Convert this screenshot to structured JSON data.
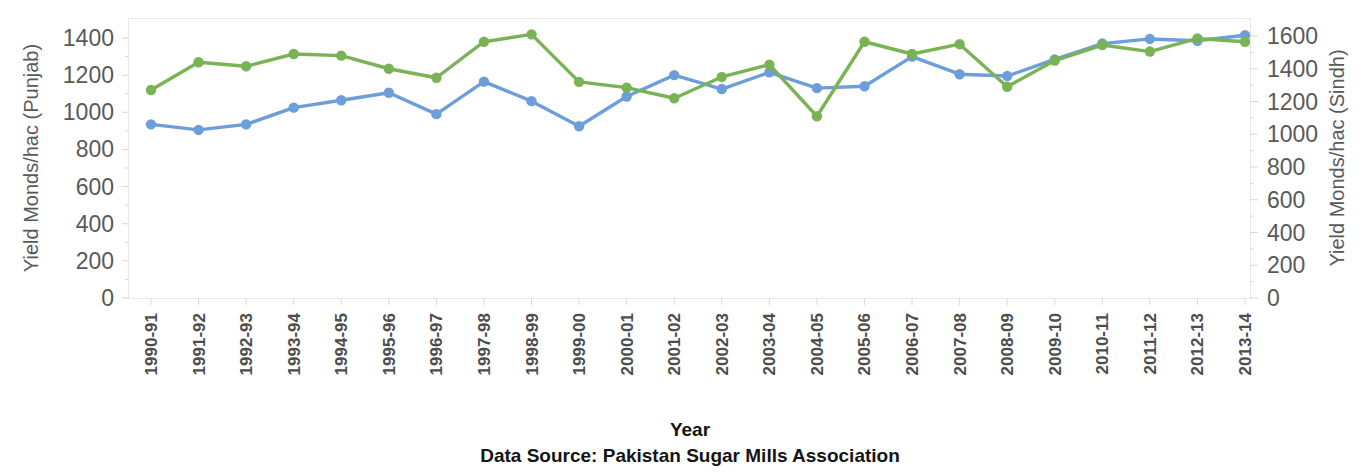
{
  "chart_data": {
    "type": "line",
    "title": "",
    "xlabel": "Year",
    "source_note": "Data Source: Pakistan Sugar Mills Association",
    "grid": false,
    "legend": "none",
    "categories": [
      "1990-91",
      "1991-92",
      "1992-93",
      "1993-94",
      "1994-95",
      "1995-96",
      "1996-97",
      "1997-98",
      "1998-99",
      "1999-00",
      "2000-01",
      "2001-02",
      "2002-03",
      "2003-04",
      "2004-05",
      "2005-06",
      "2006-07",
      "2007-08",
      "2008-09",
      "2009-10",
      "2010-11",
      "2011-12",
      "2012-13",
      "2013-14"
    ],
    "axes": {
      "left": {
        "label": "Yield Monds/hac (Punjab)",
        "ticks": [
          0,
          200,
          400,
          600,
          800,
          1000,
          1200,
          1400
        ],
        "tick_labels": [
          "0",
          "200",
          "400",
          "600",
          "800",
          "1000",
          "1200",
          "1400"
        ],
        "min": 0,
        "max": 1400
      },
      "right": {
        "label": "Yield Monds/hac (Sindh)",
        "ticks": [
          0,
          200,
          400,
          600,
          800,
          1000,
          1200,
          1400,
          1600
        ],
        "tick_labels": [
          "0",
          "200",
          "400",
          "600",
          "800",
          "1000",
          "1200",
          "1400",
          "1600"
        ],
        "min": 0,
        "max": 1600
      }
    },
    "series": [
      {
        "name": "Punjab",
        "axis": "left",
        "color": "#6d9eda",
        "values": [
          935,
          905,
          935,
          1025,
          1065,
          1105,
          990,
          1165,
          1060,
          925,
          1085,
          1200,
          1125,
          1215,
          1130,
          1140,
          1300,
          1205,
          1195,
          1285,
          1370,
          1395,
          1385,
          1415
        ]
      },
      {
        "name": "Sindh",
        "axis": "right",
        "color": "#7ab356",
        "values": [
          1270,
          1440,
          1415,
          1490,
          1480,
          1400,
          1345,
          1565,
          1610,
          1320,
          1285,
          1220,
          1350,
          1425,
          1110,
          1565,
          1490,
          1550,
          1290,
          1450,
          1545,
          1505,
          1585,
          1565
        ]
      }
    ]
  },
  "colors": {
    "punjab": "#6d9eda",
    "sindh": "#7ab356",
    "axis_text": "#595959",
    "xtick_text": "#4d4d4d",
    "title_text": "#141414",
    "frame": "#e8e8e8"
  }
}
